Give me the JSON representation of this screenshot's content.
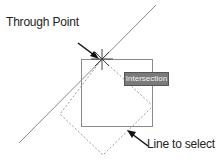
{
  "labels": {
    "through_point": "Through Point",
    "line_to_select": "Line to select",
    "tooltip": "Intersection"
  },
  "colors": {
    "line": "#8a8a8a",
    "arrow": "#111111",
    "tooltip_bg": "#7a7a7a",
    "tooltip_text": "#f4f4f4"
  }
}
